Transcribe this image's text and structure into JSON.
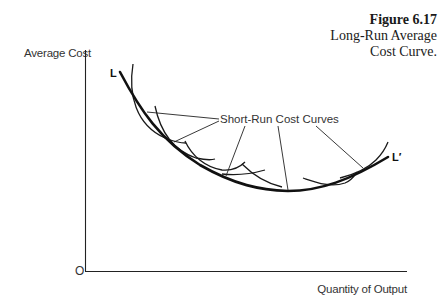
{
  "figure": {
    "number": "Figure 6.17",
    "title_line1": "Long-Run Average",
    "title_line2": "Cost Curve."
  },
  "axes": {
    "y_label": "Average Cost",
    "x_label": "Quantity of Output",
    "origin_label": "O"
  },
  "curves": {
    "long_run_start_label": "L",
    "long_run_end_label": "L′",
    "short_run_annotation": "Short-Run Cost Curves",
    "short_run_count": 6
  },
  "colors": {
    "ink": "#111111",
    "text": "#333333",
    "background": "#ffffff"
  }
}
